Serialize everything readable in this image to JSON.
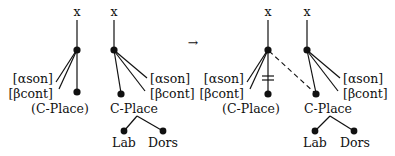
{
  "diagram": {
    "type": "autosegmental-feature-geometry",
    "arrow": "→",
    "colors": {
      "ink": "#111111",
      "background": "#ffffff"
    },
    "left_side": {
      "tree1": {
        "root": "x",
        "features": [
          "[αson]",
          "[βcont]"
        ],
        "place": "(C-Place)"
      },
      "tree2": {
        "root": "x",
        "features": [
          "[αson]",
          "[βcont]"
        ],
        "place": "C-Place",
        "articulators": [
          "Lab",
          "Dors"
        ]
      }
    },
    "right_side": {
      "tree1": {
        "root": "x",
        "features": [
          "[αson]",
          "[βcont]"
        ],
        "place": "(C-Place)",
        "delinked": true
      },
      "tree2": {
        "root": "x",
        "features": [
          "[αson]",
          "[βcont]"
        ],
        "place": "C-Place",
        "articulators": [
          "Lab",
          "Dors"
        ],
        "spread_from_tree1": true
      }
    }
  }
}
